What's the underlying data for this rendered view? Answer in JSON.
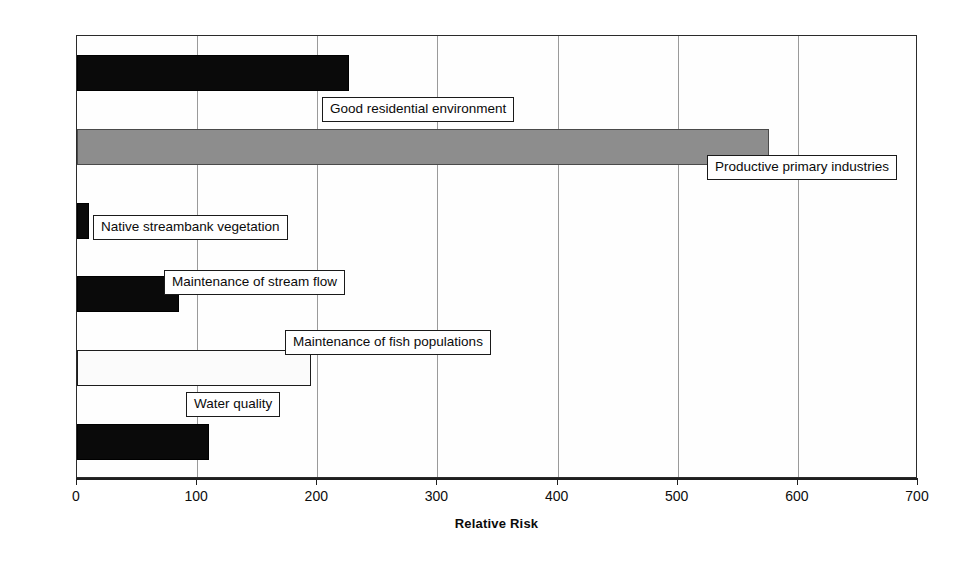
{
  "chart_data": {
    "type": "bar",
    "orientation": "horizontal",
    "title": "",
    "xlabel": "Relative Risk",
    "ylabel": "Assessment Endpoint",
    "xlim": [
      0,
      700
    ],
    "xticks": [
      0,
      100,
      200,
      300,
      400,
      500,
      600,
      700
    ],
    "xticklabels": [
      "0",
      "100",
      "200",
      "300",
      "400",
      "500",
      "600",
      "700"
    ],
    "grid": "vertical",
    "legend": "none",
    "categories": [
      "Good residential environment",
      "Productive primary industries",
      "Native streambank vegetation",
      "Maintenance of stream flow",
      "Maintenance of fish populations",
      "Water quality"
    ],
    "values": [
      226,
      576,
      10,
      85,
      195,
      110
    ],
    "bars": [
      {
        "label": "Good residential environment",
        "value": 226,
        "fill": "black",
        "color": "#0a0a0a",
        "label_left_px": 322,
        "label_top_px": 97
      },
      {
        "label": "Productive primary industries",
        "value": 576,
        "fill": "gray",
        "color": "#8d8d8d",
        "label_left_px": 707,
        "label_top_px": 155
      },
      {
        "label": "Native streambank vegetation",
        "value": 10,
        "fill": "black",
        "color": "#0a0a0a",
        "label_left_px": 93,
        "label_top_px": 215
      },
      {
        "label": "Maintenance of stream flow",
        "value": 85,
        "fill": "black",
        "color": "#0a0a0a",
        "label_left_px": 164,
        "label_top_px": 270
      },
      {
        "label": "Maintenance of fish populations",
        "value": 195,
        "fill": "white",
        "color": "#fbfbfb",
        "label_left_px": 285,
        "label_top_px": 330
      },
      {
        "label": "Water quality",
        "value": 110,
        "fill": "black",
        "color": "#0a0a0a",
        "label_left_px": 186,
        "label_top_px": 392
      }
    ]
  },
  "axes": {
    "x_title": "Relative Risk",
    "y_title": "Assessment Endpoint"
  }
}
